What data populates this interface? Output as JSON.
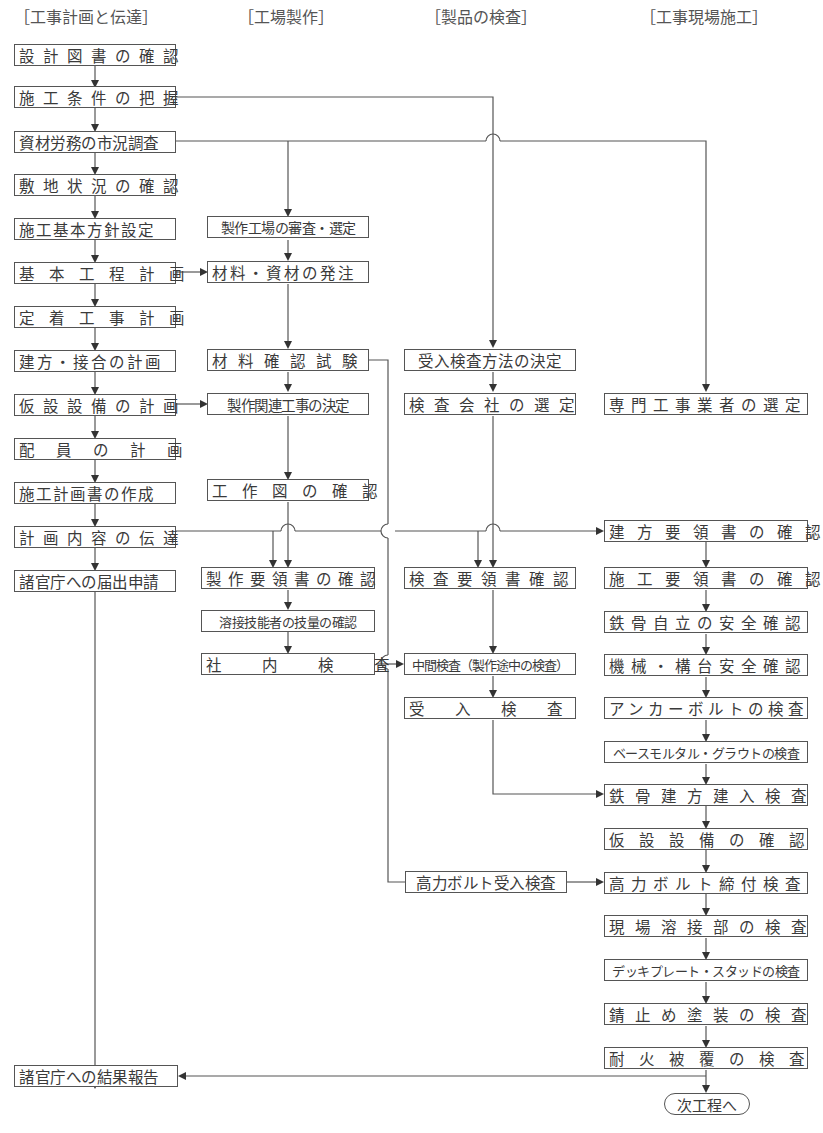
{
  "columns": [
    {
      "id": "plan",
      "label": "［工事計画と伝達］"
    },
    {
      "id": "factory",
      "label": "［工場製作］"
    },
    {
      "id": "inspect",
      "label": "［製品の検査］"
    },
    {
      "id": "site",
      "label": "［工事現場施工］"
    }
  ],
  "nodes": {
    "p1": "設計図書の確認",
    "p2": "施工条件の把握",
    "p3": "資材労務の市況調査",
    "p4": "敷地状況の確認",
    "p5": "施工基本方針設定",
    "p6": "基本工程計画",
    "p7": "定着工事計画",
    "p8": "建方・接合の計画",
    "p9": "仮設設備の計画",
    "p10": "配員の計画",
    "p11": "施工計画書の作成",
    "p12": "計画内容の伝達",
    "p13": "諸官庁への届出申請",
    "p14": "諸官庁への結果報告",
    "f1": "製作工場の審査・選定",
    "f2": "材料・資材の発注",
    "f3": "材料確認試験",
    "f4": "製作関連工事の決定",
    "f5": "工作図の確認",
    "f6": "製作要領書の確認",
    "f7": "溶接技能者の技量の確認",
    "f8": "社内検査",
    "i1": "受入検査方法の決定",
    "i2": "検査会社の選定",
    "i3": "検査要領書確認",
    "i4": "中間検査（製作途中の検査）",
    "i5": "受入検査",
    "i6": "高力ボルト受入検査",
    "s1": "専門工事業者の選定",
    "s2": "建方要領書の確認",
    "s3": "施工要領書の確認",
    "s4": "鉄骨自立の安全確認",
    "s5": "機械・構台安全確認",
    "s6": "アンカーボルトの検査",
    "s7": "ベースモルタル・グラウトの検査",
    "s8": "鉄骨建方建入検査",
    "s9": "仮設設備の確認",
    "s10": "高力ボルト締付検査",
    "s11": "現場溶接部の検査",
    "s12": "デッキプレート・スタッドの検査",
    "s13": "錆止め塗装の検査",
    "s14": "耐火被覆の検査",
    "end": "次工程へ"
  },
  "edges": [
    [
      "p1",
      "p2"
    ],
    [
      "p2",
      "p3"
    ],
    [
      "p3",
      "p4"
    ],
    [
      "p4",
      "p5"
    ],
    [
      "p5",
      "p6"
    ],
    [
      "p6",
      "p7"
    ],
    [
      "p7",
      "p8"
    ],
    [
      "p8",
      "p9"
    ],
    [
      "p9",
      "p10"
    ],
    [
      "p10",
      "p11"
    ],
    [
      "p11",
      "p12"
    ],
    [
      "p12",
      "p13"
    ],
    [
      "p13",
      "p14"
    ],
    [
      "p2",
      "i1"
    ],
    [
      "p3",
      "f1"
    ],
    [
      "p3",
      "s1"
    ],
    [
      "p6",
      "f2"
    ],
    [
      "p9",
      "f4"
    ],
    [
      "f1",
      "f2"
    ],
    [
      "f2",
      "f3"
    ],
    [
      "f3",
      "f4"
    ],
    [
      "f4",
      "f5"
    ],
    [
      "f5",
      "f6"
    ],
    [
      "f6",
      "f7"
    ],
    [
      "f7",
      "f8"
    ],
    [
      "f3",
      "i6"
    ],
    [
      "f8",
      "i4"
    ],
    [
      "p12",
      "f6"
    ],
    [
      "p12",
      "i3"
    ],
    [
      "p12",
      "s2"
    ],
    [
      "i1",
      "i2"
    ],
    [
      "i2",
      "i3"
    ],
    [
      "i3",
      "i4"
    ],
    [
      "i4",
      "i5"
    ],
    [
      "i5",
      "s8"
    ],
    [
      "i6",
      "s10"
    ],
    [
      "s1",
      "s2"
    ],
    [
      "s2",
      "s3"
    ],
    [
      "s3",
      "s4"
    ],
    [
      "s4",
      "s5"
    ],
    [
      "s5",
      "s6"
    ],
    [
      "s6",
      "s7"
    ],
    [
      "s7",
      "s8"
    ],
    [
      "s8",
      "s9"
    ],
    [
      "s9",
      "s10"
    ],
    [
      "s10",
      "s11"
    ],
    [
      "s11",
      "s12"
    ],
    [
      "s12",
      "s13"
    ],
    [
      "s13",
      "s14"
    ],
    [
      "s14",
      "end"
    ],
    [
      "s14",
      "p14"
    ]
  ]
}
